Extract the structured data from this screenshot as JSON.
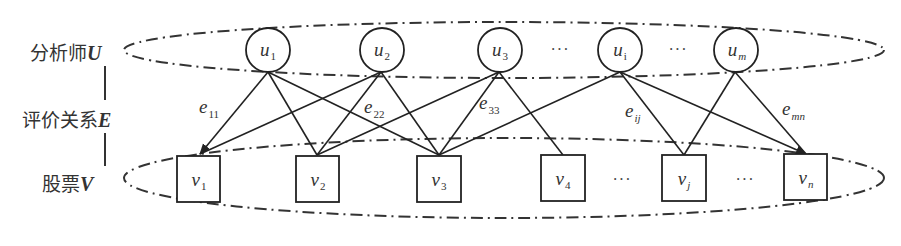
{
  "diagram": {
    "type": "bipartite-graph",
    "row_labels": {
      "analysts": {
        "text": "分析师",
        "symbol": "U"
      },
      "relations": {
        "text": "评价关系",
        "symbol": "E"
      },
      "stocks": {
        "text": "股票",
        "symbol": "V"
      }
    },
    "analyst_nodes": [
      {
        "id": "u1",
        "base": "u",
        "sub": "1",
        "sub_italic": false
      },
      {
        "id": "u2",
        "base": "u",
        "sub": "2",
        "sub_italic": false
      },
      {
        "id": "u3",
        "base": "u",
        "sub": "3",
        "sub_italic": false
      },
      {
        "id": "ui",
        "base": "u",
        "sub": "i",
        "sub_italic": false
      },
      {
        "id": "um",
        "base": "u",
        "sub": "m",
        "sub_italic": true
      }
    ],
    "stock_nodes": [
      {
        "id": "v1",
        "base": "v",
        "sub": "1",
        "sub_italic": false
      },
      {
        "id": "v2",
        "base": "v",
        "sub": "2",
        "sub_italic": false
      },
      {
        "id": "v3",
        "base": "v",
        "sub": "3",
        "sub_italic": false
      },
      {
        "id": "v4",
        "base": "v",
        "sub": "4",
        "sub_italic": false
      },
      {
        "id": "vj",
        "base": "v",
        "sub": "j",
        "sub_italic": true
      },
      {
        "id": "vn",
        "base": "v",
        "sub": "n",
        "sub_italic": true
      }
    ],
    "ellipsis": "···",
    "edges": [
      [
        "u1",
        "v1"
      ],
      [
        "u1",
        "v2"
      ],
      [
        "u1",
        "v3"
      ],
      [
        "u2",
        "v1"
      ],
      [
        "u2",
        "v2"
      ],
      [
        "u2",
        "v3"
      ],
      [
        "u3",
        "v2"
      ],
      [
        "u3",
        "v3"
      ],
      [
        "u3",
        "v4"
      ],
      [
        "ui",
        "v3"
      ],
      [
        "ui",
        "vj"
      ],
      [
        "ui",
        "vn"
      ],
      [
        "um",
        "vj"
      ],
      [
        "um",
        "vn"
      ]
    ],
    "edge_labels": [
      {
        "base": "e",
        "sub": "11",
        "sub_italic": false
      },
      {
        "base": "e",
        "sub": "22",
        "sub_italic": false
      },
      {
        "base": "e",
        "sub": "33",
        "sub_italic": false
      },
      {
        "base": "e",
        "sub": "ij",
        "sub_italic": true
      },
      {
        "base": "e",
        "sub": "mn",
        "sub_italic": true
      }
    ]
  }
}
